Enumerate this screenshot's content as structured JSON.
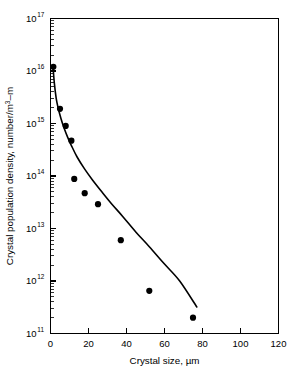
{
  "chart_data": {
    "type": "scatter",
    "title": "",
    "xlabel": "Crystal size, µm",
    "ylabel": "Crystal population density, number/m",
    "ylabel_exponent": "3",
    "ylabel_suffix": "–m",
    "xlim": [
      0,
      120
    ],
    "ylim": [
      100000000000.0,
      1e+17
    ],
    "yscale": "log",
    "xscale": "linear",
    "grid": false,
    "legend": false,
    "x_ticks": [
      0,
      20,
      40,
      60,
      80,
      100,
      120
    ],
    "x_tick_labels": [
      "0",
      "20",
      "40",
      "60",
      "80",
      "100",
      "120"
    ],
    "y_ticks": [
      100000000000.0,
      1000000000000.0,
      10000000000000.0,
      100000000000000.0,
      1000000000000000.0,
      1e+16,
      1e+17
    ],
    "y_tick_mantissa": [
      "10",
      "10",
      "10",
      "10",
      "10",
      "10",
      "10"
    ],
    "y_tick_exponents": [
      "11",
      "12",
      "13",
      "14",
      "15",
      "16",
      "17"
    ],
    "x": [
      1.5,
      5.0,
      8.0,
      11.0,
      12.5,
      18.0,
      25.0,
      37.0,
      52.0,
      75.0
    ],
    "y": [
      1.2e+16,
      1900000000000000.0,
      900000000000000.0,
      470000000000000.0,
      88000000000000.0,
      47000000000000.0,
      29000000000000.0,
      6000000000000.0,
      650000000000.0,
      200000000000.0
    ],
    "series": [
      {
        "name": "Crystal population density",
        "marker": "filled-circle",
        "marker_color": "#000000",
        "line_color": "#000000",
        "points": [
          {
            "x": 1.5,
            "y": 1.2e+16
          },
          {
            "x": 5.0,
            "y": 1900000000000000.0
          },
          {
            "x": 8.0,
            "y": 900000000000000.0
          },
          {
            "x": 11.0,
            "y": 470000000000000.0
          },
          {
            "x": 12.5,
            "y": 88000000000000.0
          },
          {
            "x": 18.0,
            "y": 47000000000000.0
          },
          {
            "x": 25.0,
            "y": 29000000000000.0
          },
          {
            "x": 37.0,
            "y": 6000000000000.0
          },
          {
            "x": 52.0,
            "y": 650000000000.0
          },
          {
            "x": 75.0,
            "y": 200000000000.0
          }
        ]
      }
    ],
    "fit_curve": {
      "name": "fitted-trend-curve",
      "x": [
        1.3,
        2.0,
        3.0,
        4.0,
        5.5,
        7.0,
        9.0,
        11.0,
        14.0,
        18.0,
        22.0,
        27.0,
        32.0,
        38.0,
        45.0,
        52.0,
        60.0,
        68.0,
        77.0
      ],
      "y": [
        1.25e+16,
        6000000000000000.0,
        3000000000000000.0,
        2000000000000000.0,
        1250000000000000.0,
        850000000000000.0,
        550000000000000.0,
        380000000000000.0,
        230000000000000.0,
        135000000000000.0,
        85000000000000.0,
        50000000000000.0,
        30000000000000.0,
        17000000000000.0,
        8500000000000.0,
        4500000000000.0,
        2100000000000.0,
        1000000000000.0,
        320000000000.0
      ]
    },
    "colors": {
      "axis": "#000000",
      "marker": "#000000",
      "curve": "#000000",
      "background": "#ffffff"
    }
  }
}
